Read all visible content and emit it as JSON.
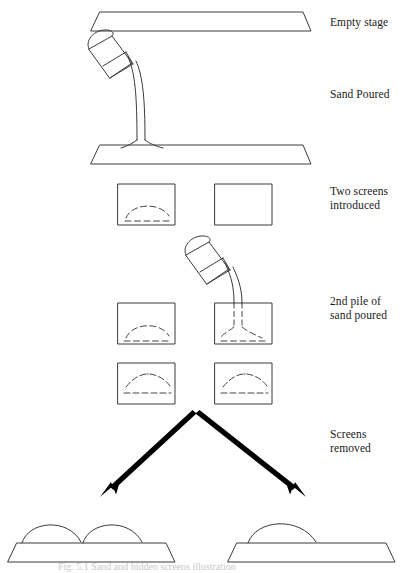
{
  "figure": {
    "caption": "Fig. 5.1 Sand and hidden screens illustration",
    "line_color": "#3a3a3a",
    "arrow_color": "#000000",
    "background": "#ffffff",
    "dash_color": "#444444"
  },
  "labels": [
    {
      "id": "empty-stage",
      "text": "Empty stage"
    },
    {
      "id": "sand-poured",
      "text": "Sand Poured"
    },
    {
      "id": "two-screens",
      "text": "Two screens\nintroduced"
    },
    {
      "id": "second-pile",
      "text": "2nd pile of\nsand poured"
    },
    {
      "id": "screens-removed",
      "text": "Screens\nremoved"
    }
  ],
  "stages": {
    "empty_stage": {
      "label": "Empty stage",
      "piles": 0
    },
    "sand_poured": {
      "label": "Sand Poured",
      "piles": 1,
      "pouring": true
    },
    "screens_introduced": {
      "label": "Two screens introduced",
      "left_screen_hidden_pile": true,
      "right_screen_hidden_pile": false
    },
    "second_pile_poured": {
      "label": "2nd pile of sand poured",
      "left_screen_hidden_pile": true,
      "right_screen_hidden_pile": true,
      "pouring": true
    },
    "both_screens_filled": {
      "label": "Both screens conceal piles",
      "left_screen_hidden_pile": true,
      "right_screen_hidden_pile": true
    },
    "outcome_left": {
      "label": "Two separate piles",
      "pile_count": 2
    },
    "outcome_right": {
      "label": "One merged pile",
      "pile_count": 1
    }
  }
}
